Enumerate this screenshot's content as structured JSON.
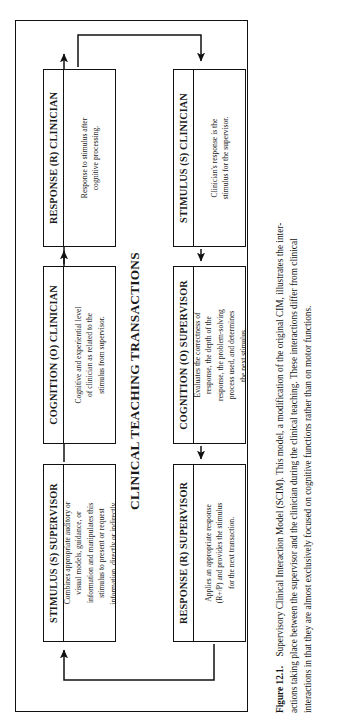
{
  "figure": {
    "diagram_title": "CLINICAL TEACHING TRANSACTIONS",
    "nodes": [
      {
        "id": "response-clinician",
        "header": "RESPONSE (R) CLINICIAN",
        "body_lines": [
          "Response to stimulus after",
          "cognitive processing."
        ]
      },
      {
        "id": "cognition-clinician",
        "header": "COGNITION (O) CLINICIAN",
        "body_lines": [
          "Cognitive and experiential level",
          "of clinician as related to the",
          "stimulus from supervisor."
        ]
      },
      {
        "id": "stimulus-supervisor",
        "header": "STIMULUS (S) SUPERVISOR",
        "body_lines": [
          "Combines appropriate auditory or",
          "visual models, guidance, or",
          "information and manipulates this",
          "stimulus to present or request",
          "information, directly or indirectly."
        ]
      },
      {
        "id": "stimulus-clinician",
        "header": "STIMULUS (S) CLINICIAN",
        "body_lines": [
          "Clinician's response is the",
          "stimulus for the supervisor."
        ]
      },
      {
        "id": "cognition-supervisor",
        "header": "COGNITION (O) SUPERVISOR",
        "body_lines": [
          "Evaluates the correctness of",
          "response, the depth of the",
          "response, the problem-solving",
          "process used, and determines",
          "the next stimulus."
        ]
      },
      {
        "id": "response-supervisor",
        "header": "RESPONSE (R) SUPERVISOR",
        "body_lines": [
          "Applies an appropriate response",
          "(R+/P) and provides the stimulus",
          "for the next transaction."
        ]
      }
    ]
  },
  "caption": {
    "label": "Figure 12.1.",
    "lines": [
      "Supervisory Clinical Interaction Model (SCIM). This model, a modification of the original CIM, illustrates the inter-",
      "actions taking place between the supervisor and the clinician during the clinical teaching. These interactions differ from clinical",
      "interactions in that they are almost exclusively focused on cognitive functions rather than on motor functions."
    ]
  },
  "colors": {
    "ink": "#111111",
    "paper": "#ffffff"
  }
}
